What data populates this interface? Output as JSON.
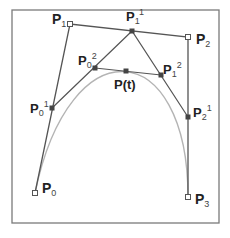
{
  "diagram": {
    "colors": {
      "frame": "#7a7a7a",
      "control_polygon": "#555555",
      "curve": "#b4b4b4",
      "text": "#222222",
      "hollow_point_fill": "#ffffff",
      "solid_point_fill": "#444444"
    },
    "frame": {
      "x": 12,
      "y": 10,
      "w": 207,
      "h": 213
    },
    "points": {
      "P0": {
        "x": 35,
        "y": 193,
        "style": "hollow",
        "base": "P",
        "sub": "0",
        "sup": ""
      },
      "P1": {
        "x": 70,
        "y": 24,
        "style": "hollow",
        "base": "P",
        "sub": "1",
        "sup": ""
      },
      "P2": {
        "x": 188,
        "y": 37,
        "style": "hollow",
        "base": "P",
        "sub": "2",
        "sup": ""
      },
      "P3": {
        "x": 188,
        "y": 197,
        "style": "hollow",
        "base": "P",
        "sub": "3",
        "sup": ""
      },
      "P01": {
        "x": 52,
        "y": 108,
        "style": "solid",
        "base": "P",
        "sub": "0",
        "sup": "1"
      },
      "P11": {
        "x": 132,
        "y": 31,
        "style": "solid",
        "base": "P",
        "sub": "1",
        "sup": "1"
      },
      "P21": {
        "x": 188,
        "y": 117,
        "style": "solid",
        "base": "P",
        "sub": "2",
        "sup": "1"
      },
      "P02": {
        "x": 95,
        "y": 68,
        "style": "solid",
        "base": "P",
        "sub": "0",
        "sup": "2"
      },
      "P12": {
        "x": 161,
        "y": 75,
        "style": "solid",
        "base": "P",
        "sub": "1",
        "sup": "2"
      },
      "Pt": {
        "x": 126,
        "y": 71,
        "style": "solid",
        "base": "P(t)",
        "sub": "",
        "sup": ""
      }
    },
    "labels": {
      "P0": {
        "base": "P",
        "sub": "0"
      },
      "P1": {
        "base": "P",
        "sub": "1"
      },
      "P2": {
        "base": "P",
        "sub": "2"
      },
      "P3": {
        "base": "P",
        "sub": "3"
      },
      "P01": {
        "base": "P",
        "sub": "0",
        "sup": "1"
      },
      "P11": {
        "base": "P",
        "sub": "1",
        "sup": "1"
      },
      "P21": {
        "base": "P",
        "sub": "2",
        "sup": "1"
      },
      "P02": {
        "base": "P",
        "sub": "0",
        "sup": "2"
      },
      "P12": {
        "base": "P",
        "sub": "1",
        "sup": "2"
      },
      "Pt": {
        "base": "P(t)"
      }
    },
    "segments": [
      [
        "P0",
        "P1"
      ],
      [
        "P1",
        "P2"
      ],
      [
        "P2",
        "P3"
      ],
      [
        "P01",
        "P11"
      ],
      [
        "P11",
        "P21"
      ],
      [
        "P02",
        "P12"
      ]
    ]
  }
}
